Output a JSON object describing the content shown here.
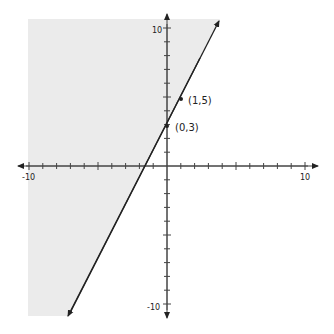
{
  "chart_data": {
    "type": "line",
    "title": "",
    "line": {
      "equation": "y = 2x + 3",
      "slope": 2,
      "intercept": 3
    },
    "points": [
      {
        "x": 0,
        "y": 3,
        "label": "(0,3)"
      },
      {
        "x": 1,
        "y": 5,
        "label": "(1,5)"
      }
    ],
    "shaded_region": "left of line (y >= 2x + 3)",
    "xlim": [
      -10,
      10
    ],
    "ylim": [
      -10,
      10
    ],
    "x_tick_labels": [
      "-10",
      "10"
    ],
    "y_tick_labels": [
      "10",
      "-10"
    ],
    "grid": false,
    "colors": {
      "shade": "#ebebeb",
      "line": "#222222",
      "axis": "#444444"
    }
  },
  "labels": {
    "x_min": "-10",
    "x_max": "10",
    "y_max": "10",
    "y_min": "-10",
    "p1": "(1,5)",
    "p0": "(0,3)"
  }
}
